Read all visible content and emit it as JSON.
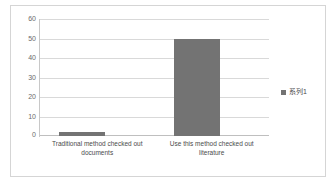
{
  "chart_data": {
    "type": "bar",
    "title": "",
    "subtitle": "",
    "xlabel": "",
    "ylabel": "",
    "categories": [
      "Traditional method checked out documents",
      "Use this method checked out literature"
    ],
    "series": [
      {
        "name": "系列1",
        "values": [
          2,
          50
        ]
      }
    ],
    "values": [
      2,
      50
    ],
    "ylim": [
      0,
      60
    ],
    "ytick_labels": [
      "60",
      "50",
      "40",
      "30",
      "20",
      "10",
      "0"
    ],
    "ytick_values": [
      60,
      50,
      40,
      30,
      20,
      10,
      0
    ],
    "grid": "horizontal",
    "legend_position": "right",
    "colors": {
      "bar": "#737373",
      "gridline": "#d9d9d9",
      "axis": "#c8c8c8",
      "tick_text": "#6b6b6b",
      "label_text": "#4a4a4a",
      "card_border": "#d5d5d5",
      "background": "#ffffff"
    }
  },
  "legend": {
    "marker_name": "legend-color-swatch",
    "label": "系列1"
  },
  "axis": {
    "y": {
      "t0": "60",
      "t1": "50",
      "t2": "40",
      "t3": "30",
      "t4": "20",
      "t5": "10",
      "t6": "0"
    },
    "x": {
      "cat0": "Traditional method checked out documents",
      "cat1": "Use this method checked out literature"
    }
  }
}
